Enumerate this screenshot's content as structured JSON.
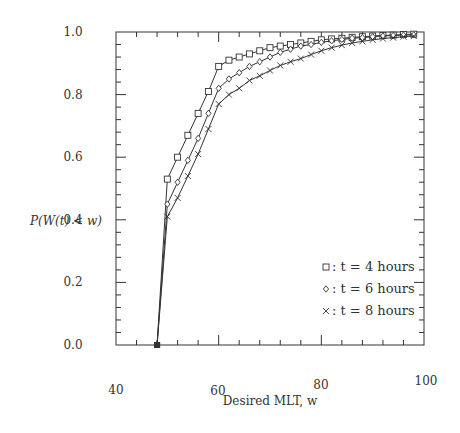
{
  "chart_data": {
    "type": "line",
    "title": "",
    "xlabel": "Desired MLT, w",
    "ylabel": "P(W(t) < w)",
    "xlim": [
      40,
      100
    ],
    "ylim": [
      0.0,
      1.0
    ],
    "x_ticks": [
      "40",
      "60",
      "80",
      "100"
    ],
    "y_ticks": [
      "0.0",
      "0.2",
      "0.4",
      "0.6",
      "0.8",
      "1.0"
    ],
    "grid": false,
    "legend_position": "lower right inside",
    "x": [
      48,
      50,
      52,
      54,
      56,
      58,
      60,
      62,
      64,
      66,
      68,
      70,
      72,
      74,
      76,
      78,
      80,
      82,
      84,
      86,
      88,
      90,
      92,
      94,
      96,
      98
    ],
    "series": [
      {
        "name": "t = 4 hours",
        "marker": "square",
        "legend": "□: t = 4 hours",
        "values": [
          0.0,
          0.53,
          0.6,
          0.67,
          0.74,
          0.81,
          0.89,
          0.91,
          0.92,
          0.93,
          0.94,
          0.95,
          0.955,
          0.96,
          0.965,
          0.97,
          0.975,
          0.978,
          0.98,
          0.983,
          0.985,
          0.987,
          0.989,
          0.99,
          0.992,
          0.993
        ]
      },
      {
        "name": "t = 6 hours",
        "marker": "diamond",
        "legend": "◇: t = 6 hours",
        "values": [
          0.0,
          0.45,
          0.52,
          0.59,
          0.66,
          0.74,
          0.82,
          0.85,
          0.87,
          0.89,
          0.905,
          0.92,
          0.935,
          0.945,
          0.955,
          0.96,
          0.967,
          0.972,
          0.976,
          0.98,
          0.982,
          0.985,
          0.987,
          0.989,
          0.99,
          0.991
        ]
      },
      {
        "name": "t = 8 hours",
        "marker": "cross",
        "legend": "×: t = 8 hours",
        "values": [
          0.0,
          0.41,
          0.47,
          0.54,
          0.61,
          0.69,
          0.77,
          0.8,
          0.82,
          0.845,
          0.86,
          0.877,
          0.893,
          0.905,
          0.915,
          0.928,
          0.94,
          0.95,
          0.958,
          0.965,
          0.97,
          0.975,
          0.979,
          0.982,
          0.985,
          0.987
        ]
      }
    ]
  },
  "legend": {
    "items": [
      {
        "symbol": "□",
        "label": ": t = 4 hours"
      },
      {
        "symbol": "◇",
        "label": ": t = 6 hours"
      },
      {
        "symbol": "×",
        "label": ": t = 8 hours"
      }
    ]
  }
}
